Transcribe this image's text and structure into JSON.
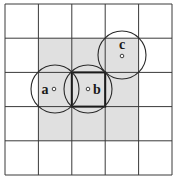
{
  "diagram": {
    "grid": {
      "cols": 5,
      "rows": 5,
      "x0": 5,
      "y0": 4,
      "x1": 172,
      "y1": 175,
      "line_color": "#3a3a3a",
      "background": "#ffffff"
    },
    "shaded_region": {
      "col_start": 1,
      "col_end": 3,
      "row_start": 1,
      "row_end": 3,
      "color": "#e0e0e0"
    },
    "highlighted_cell": {
      "col": 2,
      "row": 2
    },
    "circles": [
      {
        "id": "a",
        "label": "a",
        "cx": 55,
        "cy": 89,
        "r": 24,
        "dot_x": 54,
        "dot_y": 89,
        "label_x": 45,
        "label_y": 94
      },
      {
        "id": "b",
        "label": "b",
        "cx": 88,
        "cy": 89,
        "r": 24,
        "dot_x": 88,
        "dot_y": 89,
        "label_x": 97,
        "label_y": 94
      },
      {
        "id": "c",
        "label": "c",
        "cx": 122,
        "cy": 55,
        "r": 24,
        "dot_x": 122,
        "dot_y": 56,
        "label_x": 122,
        "label_y": 49
      }
    ]
  }
}
